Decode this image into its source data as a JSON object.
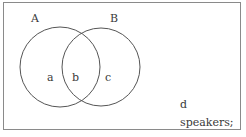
{
  "diagram": {
    "type": "venn",
    "sets": [
      {
        "name": "A",
        "cx": 60,
        "cy": 67,
        "r": 40
      },
      {
        "name": "B",
        "cx": 101,
        "cy": 67,
        "r": 39
      }
    ],
    "set_labels": {
      "A": "A",
      "B": "B"
    },
    "regions": {
      "a": "a",
      "b": "b",
      "c": "c",
      "d": "d"
    },
    "caption": "speakers;",
    "colors": {
      "stroke": "#555555",
      "frame": "#8a8a8a",
      "text": "#3a3a3a",
      "background": "#ffffff"
    }
  }
}
